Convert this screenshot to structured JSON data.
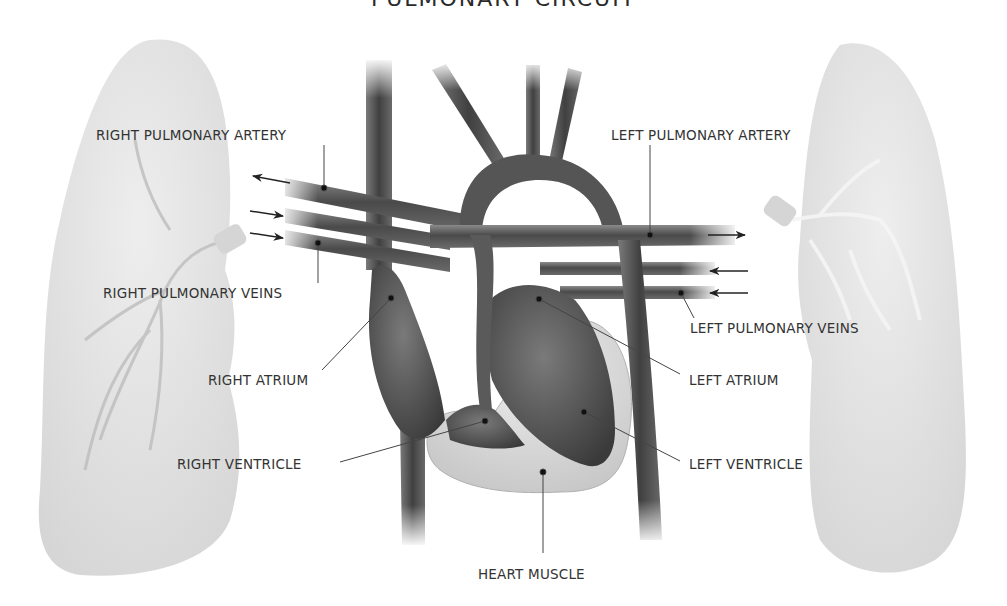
{
  "title": "PULMONARY CIRCUIT",
  "labels": {
    "right_pulmonary_artery": "RIGHT PULMONARY ARTERY",
    "left_pulmonary_artery": "LEFT PULMONARY ARTERY",
    "right_pulmonary_veins": "RIGHT PULMONARY VEINS",
    "left_pulmonary_veins": "LEFT PULMONARY VEINS",
    "right_atrium": "RIGHT ATRIUM",
    "left_atrium": "LEFT ATRIUM",
    "right_ventricle": "RIGHT VENTRICLE",
    "left_ventricle": "LEFT VENTRICLE",
    "heart_muscle": "HEART MUSCLE"
  },
  "colors": {
    "vessel": "#5a5a5a",
    "vessel_dark": "#3a3a3a",
    "heart_muscle": "#d8d8d8",
    "lung": "#e4e4e4",
    "leader_line": "#444444",
    "text": "#333333"
  }
}
